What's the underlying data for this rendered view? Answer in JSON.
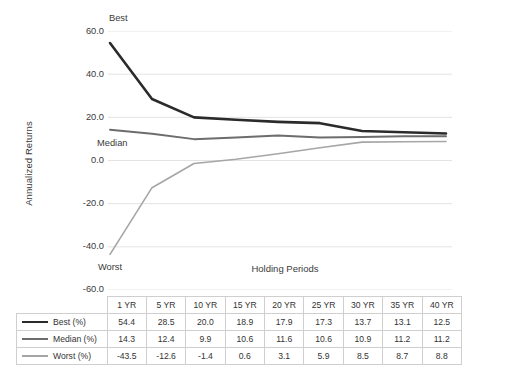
{
  "chart_data": {
    "type": "line",
    "title": "",
    "xlabel": "Holding Periods",
    "ylabel": "Annualized Returns",
    "categories": [
      "1 YR",
      "5 YR",
      "10 YR",
      "15 YR",
      "20 YR",
      "25 YR",
      "30 YR",
      "35 YR",
      "40 YR"
    ],
    "ylim": [
      -60,
      60
    ],
    "yticks": [
      "60.0",
      "40.0",
      "20.0",
      "0.0",
      "-20.0",
      "-40.0",
      "-60.0"
    ],
    "ytick_values": [
      60,
      40,
      20,
      0,
      -20,
      -40,
      -60
    ],
    "grid": true,
    "legend_position": "table-row-labels",
    "annotations": [
      {
        "text": "Best",
        "series": "Best (%)"
      },
      {
        "text": "Median",
        "series": "Median (%)"
      },
      {
        "text": "Worst",
        "series": "Worst (%)"
      }
    ],
    "series": [
      {
        "name": "Best (%)",
        "label": "Best (%)",
        "color": "#2b2b2b",
        "width": 2.6,
        "values": [
          54.4,
          28.5,
          20.0,
          18.9,
          17.9,
          17.3,
          13.7,
          13.1,
          12.5
        ]
      },
      {
        "name": "Median (%)",
        "label": "Median (%)",
        "color": "#6d6d6d",
        "width": 2.0,
        "values": [
          14.3,
          12.4,
          9.9,
          10.6,
          11.6,
          10.6,
          10.9,
          11.2,
          11.2
        ]
      },
      {
        "name": "Worst (%)",
        "label": "Worst (%)",
        "color": "#a6a6a6",
        "width": 1.6,
        "values": [
          -43.5,
          -12.6,
          -1.4,
          0.6,
          3.1,
          5.9,
          8.5,
          8.7,
          8.8
        ]
      }
    ]
  },
  "table": {
    "header": [
      "",
      "1 YR",
      "5 YR",
      "10 YR",
      "15 YR",
      "20 YR",
      "25 YR",
      "30 YR",
      "35 YR",
      "40 YR"
    ],
    "rows": [
      {
        "label": "Best (%)",
        "swatch": "best",
        "cells": [
          "54.4",
          "28.5",
          "20.0",
          "18.9",
          "17.9",
          "17.3",
          "13.7",
          "13.1",
          "12.5"
        ]
      },
      {
        "label": "Median (%)",
        "swatch": "median",
        "cells": [
          "14.3",
          "12.4",
          "9.9",
          "10.6",
          "11.6",
          "10.6",
          "10.9",
          "11.2",
          "11.2"
        ]
      },
      {
        "label": "Worst (%)",
        "swatch": "worst",
        "cells": [
          "-43.5",
          "-12.6",
          "-1.4",
          "0.6",
          "3.1",
          "5.9",
          "8.5",
          "8.7",
          "8.8"
        ]
      }
    ]
  },
  "colors": {
    "grid": "#e3e3e3",
    "table_border": "#cfcfcf",
    "text": "#333333",
    "best": "#2b2b2b",
    "median": "#6d6d6d",
    "worst": "#a6a6a6"
  }
}
